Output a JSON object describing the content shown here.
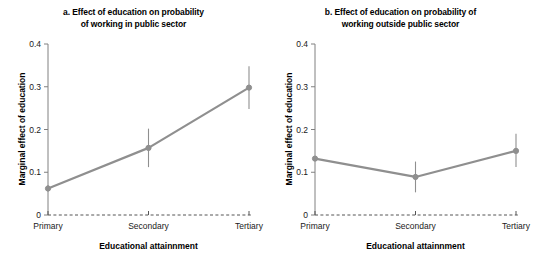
{
  "figure": {
    "background_color": "#ffffff",
    "series_color": "#8f8f8f",
    "axis_color": "#808080",
    "text_color": "#000000"
  },
  "chart_data": [
    {
      "type": "line",
      "panel_id": "a",
      "title": "a. Effect of education on probability of working in public sector",
      "title_line1": "a. Effect of education on probability",
      "title_line2": "of working in public sector",
      "xlabel": "Educational attainnment",
      "ylabel": "Marginal effect of education",
      "categories": [
        "Primary",
        "Secondary",
        "Tertiary"
      ],
      "values": [
        0.062,
        0.157,
        0.298
      ],
      "error_low": [
        0.055,
        0.112,
        0.248
      ],
      "error_high": [
        0.07,
        0.202,
        0.348
      ],
      "ylim": [
        0,
        0.4
      ],
      "yticks": [
        0,
        0.1,
        0.2,
        0.3,
        0.4
      ],
      "ytick_labels": [
        "0",
        "0.1",
        "0.2",
        "0.3",
        "0.4"
      ],
      "grid": false,
      "legend": "none",
      "zero_line": "dashed"
    },
    {
      "type": "line",
      "panel_id": "b",
      "title": "b. Effect of education on probability of working outside public sector",
      "title_line1": "b. Effect of education on probability of",
      "title_line2": "working outside public sector",
      "xlabel": "Educational attainnment",
      "ylabel": "Marginal effect of education",
      "categories": [
        "Primary",
        "Secondary",
        "Tertiary"
      ],
      "values": [
        0.132,
        0.089,
        0.15
      ],
      "error_low": [
        0.128,
        0.053,
        0.112
      ],
      "error_high": [
        0.137,
        0.125,
        0.19
      ],
      "ylim": [
        0,
        0.4
      ],
      "yticks": [
        0,
        0.1,
        0.2,
        0.3,
        0.4
      ],
      "ytick_labels": [
        "0",
        "0.1",
        "0.2",
        "0.3",
        "0.4"
      ],
      "grid": false,
      "legend": "none",
      "zero_line": "dashed"
    }
  ]
}
